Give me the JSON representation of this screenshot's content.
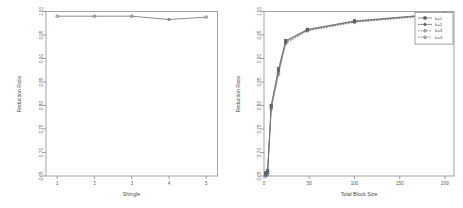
{
  "figure": {
    "background": "#ffffff",
    "panel_count": 2,
    "line_color": "#6e6e6e",
    "axis_color": "#8a8a8a",
    "text_color": "#4a4a4a"
  },
  "chart_data": [
    {
      "panel": "left",
      "type": "line",
      "title": "",
      "xlabel": "Shingle",
      "ylabel": "Reduction Ratio",
      "xlim": [
        0.7,
        5.3
      ],
      "ylim": [
        0.65,
        1.0
      ],
      "xticks": [
        1,
        2,
        3,
        4,
        5
      ],
      "xticklabels": [
        "1",
        "2",
        "3",
        "4",
        "5"
      ],
      "yticks": [
        0.65,
        0.7,
        0.75,
        0.8,
        0.85,
        0.9,
        0.95,
        1.0
      ],
      "yticklabels": [
        "0.65",
        "0.70",
        "0.75",
        "0.80",
        "0.85",
        "0.90",
        "0.95",
        "1.00"
      ],
      "grid": false,
      "legend": null,
      "marker": "open-circle",
      "series": [
        {
          "name": "reduction-ratio",
          "x": [
            1,
            2,
            3,
            4,
            5
          ],
          "values": [
            0.99,
            0.99,
            0.99,
            0.983,
            0.988
          ]
        }
      ]
    },
    {
      "panel": "right",
      "type": "line",
      "title": "",
      "xlabel": "Total Block Size",
      "ylabel": "Reduction Ratio",
      "xlim": [
        0,
        210
      ],
      "ylim": [
        0.65,
        1.0
      ],
      "xticks": [
        0,
        50,
        100,
        150,
        200
      ],
      "xticklabels": [
        "0",
        "50",
        "100",
        "150",
        "200"
      ],
      "yticks": [
        0.65,
        0.7,
        0.75,
        0.8,
        0.85,
        0.9,
        0.95,
        1.0
      ],
      "yticklabels": [
        "0.65",
        "0.70",
        "0.75",
        "0.80",
        "0.85",
        "0.90",
        "0.95",
        "1.00"
      ],
      "grid": false,
      "legend": {
        "position": "top-right",
        "entries": [
          "k=1",
          "k=2",
          "k=3",
          "k=4"
        ]
      },
      "series": [
        {
          "name": "k=1",
          "marker": "filled-square",
          "x": [
            2,
            4,
            8,
            16,
            24,
            48,
            100,
            200
          ],
          "values": [
            0.657,
            0.662,
            0.8,
            0.878,
            0.938,
            0.962,
            0.98,
            0.996
          ]
        },
        {
          "name": "k=2",
          "marker": "filled-circle",
          "x": [
            2,
            4,
            8,
            16,
            24,
            48,
            100,
            200
          ],
          "values": [
            0.654,
            0.659,
            0.799,
            0.874,
            0.936,
            0.961,
            0.979,
            0.995
          ]
        },
        {
          "name": "k=3",
          "marker": "open-circle",
          "x": [
            2,
            4,
            8,
            16,
            24,
            48,
            100,
            200
          ],
          "values": [
            0.652,
            0.656,
            0.796,
            0.87,
            0.934,
            0.96,
            0.978,
            0.995
          ]
        },
        {
          "name": "k=4",
          "marker": "open-circle",
          "x": [
            2,
            4,
            8,
            16,
            24,
            48,
            100,
            200
          ],
          "values": [
            0.65,
            0.653,
            0.793,
            0.866,
            0.932,
            0.959,
            0.977,
            0.994
          ]
        }
      ]
    }
  ]
}
